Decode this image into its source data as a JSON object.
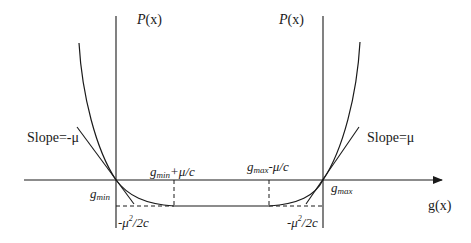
{
  "diagram": {
    "type": "penalty-function-plot",
    "colors": {
      "stroke": "#1a1a1a",
      "background": "#ffffff"
    },
    "axes": {
      "horizontal_label_fn": "g",
      "horizontal_label_arg": "(x)",
      "left_vertical_label_fn": "P",
      "left_vertical_label_arg": "(x)",
      "right_vertical_label_fn": "P",
      "right_vertical_label_arg": "(x)"
    },
    "labels": {
      "slope_left": "Slope=-μ",
      "slope_right": "Slope=μ",
      "g_min_base": "g",
      "g_min_sub": "min",
      "g_max_base": "g",
      "g_max_sub": "max",
      "g_min_plus_base": "g",
      "g_min_plus_sub": "min",
      "g_min_plus_tail": "+μ/c",
      "g_max_minus_base": "g",
      "g_max_minus_sub": "max",
      "g_max_minus_tail": "-μ/c",
      "min_value_left_pre": "-μ",
      "min_value_left_sup": "2",
      "min_value_left_post": "/2c",
      "min_value_right_pre": "-μ",
      "min_value_right_sup": "2",
      "min_value_right_post": "/2c"
    }
  }
}
